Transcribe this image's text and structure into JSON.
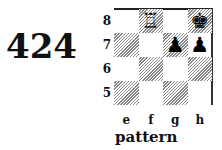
{
  "diagram": {
    "number": "424",
    "caption": "pattern",
    "files": [
      "e",
      "f",
      "g",
      "h"
    ],
    "ranks": [
      "8",
      "7",
      "6",
      "5"
    ],
    "dark_squares": [
      "f8",
      "h8",
      "e7",
      "g7",
      "f6",
      "h6",
      "e5",
      "g5"
    ],
    "pieces": [
      {
        "square": "f8",
        "piece": "white-rook",
        "glyph": "♖"
      },
      {
        "square": "h8",
        "piece": "black-king",
        "glyph": "♚"
      },
      {
        "square": "g7",
        "piece": "black-pawn",
        "glyph": "♟"
      },
      {
        "square": "h7",
        "piece": "black-pawn",
        "glyph": "♟"
      }
    ]
  }
}
